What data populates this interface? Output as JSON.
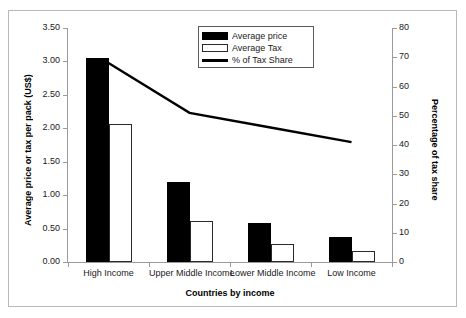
{
  "chart_data": {
    "type": "bar",
    "title": "",
    "xlabel": "Countries by income",
    "ylabel": "Average price or tax per pack (US$)",
    "y2label": "Percentage of tax share",
    "categories": [
      "High Income",
      "Upper Middle Income",
      "Lower Middle Income",
      "Low Income"
    ],
    "series": [
      {
        "name": "Average price",
        "type": "bar",
        "axis": "left",
        "color": "#000000",
        "values": [
          3.05,
          1.2,
          0.58,
          0.37
        ]
      },
      {
        "name": "Average Tax",
        "type": "bar",
        "axis": "left",
        "color": "#ffffff",
        "values": [
          2.07,
          0.62,
          0.27,
          0.16
        ]
      },
      {
        "name": "% of Tax Share",
        "type": "line",
        "axis": "right",
        "color": "#000000",
        "values": [
          68,
          51,
          46,
          41
        ]
      }
    ],
    "ylim": [
      0,
      3.5
    ],
    "ytick_labels": [
      "3.50",
      "3.00",
      "2.50",
      "2.00",
      "1.50",
      "1.00",
      "0.50",
      "0.00"
    ],
    "ytick_values": [
      3.5,
      3.0,
      2.5,
      2.0,
      1.5,
      1.0,
      0.5,
      0.0
    ],
    "y2lim": [
      0,
      80
    ],
    "y2tick_labels": [
      "80",
      "70",
      "60",
      "50",
      "40",
      "30",
      "20",
      "10",
      "0"
    ],
    "y2tick_values": [
      80,
      70,
      60,
      50,
      40,
      30,
      20,
      10,
      0
    ],
    "grid": false,
    "legend_position": "top-center",
    "legend_entries": [
      "Average price",
      "Average Tax",
      "% of Tax Share"
    ]
  },
  "figure": {
    "frame_color": "#b9b9b9",
    "background": "#ffffff",
    "axis_color": "#9a9a9a"
  }
}
